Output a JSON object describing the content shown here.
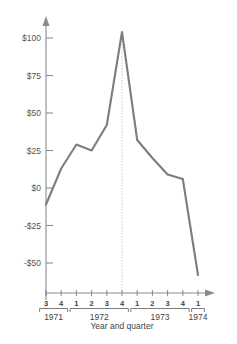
{
  "chart_data": {
    "type": "line",
    "title": "",
    "xlabel": "Year and quarter",
    "ylabel": "",
    "categories": [
      "1971 Q3",
      "1971 Q4",
      "1972 Q1",
      "1972 Q2",
      "1972 Q3",
      "1972 Q4",
      "1973 Q1",
      "1973 Q2",
      "1973 Q3",
      "1973 Q4",
      "1974 Q1"
    ],
    "quarter_ticks": [
      "3",
      "4",
      "1",
      "2",
      "3",
      "4",
      "1",
      "2",
      "3",
      "4",
      "1"
    ],
    "year_groups": [
      {
        "year": "1971",
        "quarters": [
          "3",
          "4"
        ]
      },
      {
        "year": "1972",
        "quarters": [
          "1",
          "2",
          "3",
          "4"
        ]
      },
      {
        "year": "1973",
        "quarters": [
          "1",
          "2",
          "3",
          "4"
        ]
      },
      {
        "year": "1974",
        "quarters": [
          "1"
        ]
      }
    ],
    "values": [
      -11,
      13,
      29,
      25,
      42,
      104,
      32,
      20,
      9,
      6,
      -58
    ],
    "ytick_labels": [
      "$100",
      "$75",
      "$50",
      "$25",
      "$0",
      "-$25",
      "-$50"
    ],
    "ytick_values": [
      100,
      75,
      50,
      25,
      0,
      -25,
      -50
    ],
    "ylim": [
      -62,
      112
    ],
    "grid": false,
    "legend": null,
    "annotations": [
      {
        "name": "peak-guide",
        "at_category": "1972 Q4",
        "value": 104,
        "style": "dotted vertical line from peak to axis"
      }
    ],
    "colors": {
      "line": "#7d7d7d",
      "axis": "#8c8c8c",
      "text": "#444444",
      "guide": "#bdbdbd",
      "background": "#ffffff"
    }
  }
}
